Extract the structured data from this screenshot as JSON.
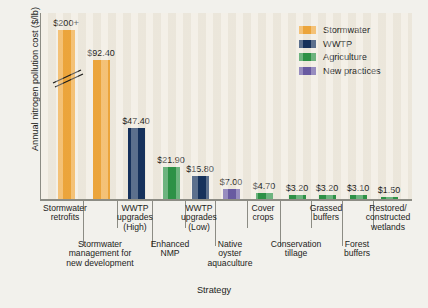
{
  "chart_data": {
    "type": "bar",
    "title": "",
    "xlabel": "Strategy",
    "ylabel": "Annual nitrogen pollution cost ($/lb)",
    "grid": false,
    "axis_break": true,
    "axis_break_note": "y-axis broken on first bar; $200+ is truncated",
    "ylim": [
      0,
      100
    ],
    "legend_position": "top-right",
    "categories": [
      "Stormwater retrofits",
      "Stormwater management for new development",
      "WWTP upgrades (High)",
      "Enhanced NMP",
      "WWTP upgrades (Low)",
      "Native oyster aquaculture",
      "Cover crops",
      "Conservation tillage",
      "Grassed buffers",
      "Forest buffers",
      "Restored/ constructed wetlands"
    ],
    "values": [
      200,
      92.4,
      47.4,
      21.9,
      15.8,
      7.0,
      4.7,
      3.2,
      3.2,
      3.1,
      1.5
    ],
    "value_labels": [
      "$200+",
      "$92.40",
      "$47.40",
      "$21.90",
      "$15.80",
      "$7.00",
      "$4.70",
      "$3.20",
      "$3.20",
      "$3.10",
      "$1.50"
    ],
    "group_of_bar": [
      "Stormwater",
      "Stormwater",
      "WWTP",
      "Agriculture",
      "WWTP",
      "New practices",
      "Agriculture",
      "Agriculture",
      "Agriculture",
      "Agriculture",
      "Agriculture"
    ]
  },
  "legend": {
    "items": [
      {
        "label": "Stormwater",
        "color": "#efa73c"
      },
      {
        "label": "WWTP",
        "color": "#16325c"
      },
      {
        "label": "Agriculture",
        "color": "#2e9347"
      },
      {
        "label": "New practices",
        "color": "#6a5ba3"
      }
    ]
  },
  "categories_top_row": [
    {
      "line1": "Stormwater",
      "line2": "retrofits",
      "line3": ""
    },
    {
      "line1": "WWTP",
      "line2": "upgrades",
      "line3": "(High)"
    },
    {
      "line1": "WWTP",
      "line2": "upgrades",
      "line3": "(Low)"
    },
    {
      "line1": "Cover",
      "line2": "crops",
      "line3": ""
    },
    {
      "line1": "Grassed",
      "line2": "buffers",
      "line3": ""
    },
    {
      "line1": "Restored/",
      "line2": "constructed",
      "line3": "wetlands"
    }
  ],
  "categories_bottom_row": [
    {
      "line1": "Stormwater",
      "line2": "management for",
      "line3": "new development"
    },
    {
      "line1": "Enhanced",
      "line2": "NMP",
      "line3": ""
    },
    {
      "line1": "Native",
      "line2": "oyster",
      "line3": "aquaculture"
    },
    {
      "line1": "Conservation",
      "line2": "tillage",
      "line3": ""
    },
    {
      "line1": "Forest",
      "line2": "buffers",
      "line3": ""
    }
  ],
  "axis": {
    "x_title": "Strategy",
    "y_title": "Annual nitrogen pollution cost ($/lb)"
  }
}
